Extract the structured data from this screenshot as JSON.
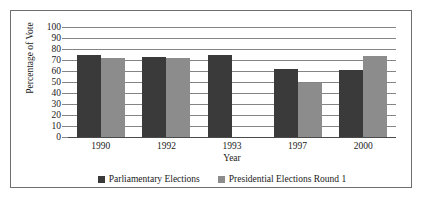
{
  "chart_data": {
    "type": "bar",
    "title": "",
    "xlabel": "Year",
    "ylabel": "Percentage of Vote",
    "categories": [
      "1990",
      "1992",
      "1993",
      "1997",
      "2000"
    ],
    "series": [
      {
        "name": "Parliamentary Elections",
        "color": "#3a3a3a",
        "values": [
          75,
          73,
          75,
          62,
          61
        ]
      },
      {
        "name": "Presidential Elections Round 1",
        "color": "#8c8c8c",
        "values": [
          72,
          72,
          null,
          49,
          74
        ]
      }
    ],
    "ylim": [
      0,
      100
    ],
    "ytick_step": 10,
    "yticks": [
      "100",
      "90",
      "80",
      "70",
      "60",
      "50",
      "40",
      "30",
      "20",
      "10",
      "0"
    ],
    "grid": true,
    "legend_position": "bottom",
    "gridline_color": "#848484",
    "frame_color": "#6f6f6f",
    "background_color": "#ffffff"
  }
}
